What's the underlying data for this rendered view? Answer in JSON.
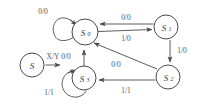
{
  "diagram": {
    "stroke_color": "#4a4a4a",
    "text_color": "#55555a",
    "background": "#ffffff"
  },
  "legend": {
    "node_label": "S",
    "arrow_label": "X/Y"
  },
  "states": [
    {
      "id": "S0",
      "label": "S",
      "subscript": "0",
      "cx": 85,
      "cy": 32,
      "r": 13
    },
    {
      "id": "S1",
      "label": "S",
      "subscript": "1",
      "cx": 166,
      "cy": 27,
      "r": 12
    },
    {
      "id": "S2",
      "label": "S",
      "subscript": "2",
      "cx": 168,
      "cy": 77,
      "r": 12
    },
    {
      "id": "S3",
      "label": "S",
      "subscript": "3",
      "cx": 84,
      "cy": 78,
      "r": 12
    }
  ],
  "transitions": [
    {
      "id": "t-s0-self",
      "from": "S0",
      "to": "S0",
      "label": "0/0",
      "label_x": 43,
      "label_y": 11
    },
    {
      "id": "t-s1-s0",
      "from": "S1",
      "to": "S0",
      "label": "0/0",
      "label_x": 126,
      "label_y": 17
    },
    {
      "id": "t-s0-s1",
      "from": "S0",
      "to": "S1",
      "label": "1/0",
      "label_x": 126,
      "label_y": 38
    },
    {
      "id": "t-s1-s2",
      "from": "S1",
      "to": "S2",
      "label": "1/0",
      "label_x": 182,
      "label_y": 50
    },
    {
      "id": "t-s2-s0",
      "from": "S2",
      "to": "S0",
      "label": "0/0",
      "label_x": 116,
      "label_y": 64
    },
    {
      "id": "t-s2-s3",
      "from": "S2",
      "to": "S3",
      "label": "1/1",
      "label_x": 126,
      "label_y": 90
    },
    {
      "id": "t-s3-s0",
      "from": "S3",
      "to": "S0",
      "label": "0/0",
      "label_x": 66,
      "label_y": 56
    },
    {
      "id": "t-s3-self",
      "from": "S3",
      "to": "S3",
      "label": "1/1",
      "label_x": 49,
      "label_y": 92
    }
  ]
}
